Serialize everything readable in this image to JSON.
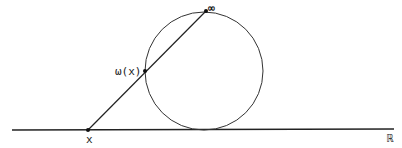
{
  "diagram": {
    "labels": {
      "point_x": "x",
      "projection": "ω(x)",
      "infinity": "∞",
      "real_line": "ℝ"
    },
    "colors": {
      "stroke": "#222222",
      "background": "#ffffff"
    }
  }
}
